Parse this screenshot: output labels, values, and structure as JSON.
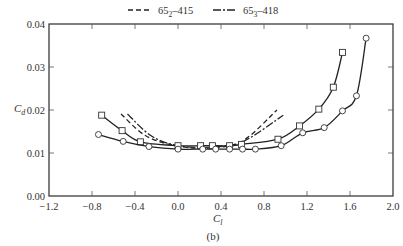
{
  "chart_data": {
    "type": "line",
    "title": "",
    "caption": "(b)",
    "xlabel": "C_l",
    "ylabel": "C_d",
    "xlim": [
      -1.2,
      2.0
    ],
    "ylim": [
      0.0,
      0.04
    ],
    "xticks": [
      -1.2,
      -0.8,
      -0.4,
      0.0,
      0.4,
      0.8,
      1.2,
      1.6,
      2.0
    ],
    "xtick_labels": [
      "−1.2",
      "−0.8",
      "−0.4",
      "0.0",
      "0.4",
      "0.8",
      "1.2",
      "1.6",
      "2.0"
    ],
    "yticks": [
      0.0,
      0.01,
      0.02,
      0.03,
      0.04
    ],
    "ytick_labels": [
      "0.00",
      "0.01",
      "0.02",
      "0.03",
      "0.04"
    ],
    "grid": false,
    "legend_position": "top-center",
    "legend": [
      {
        "label_main": "65",
        "label_sub": "2",
        "label_rest": "–415",
        "style": "dashed"
      },
      {
        "label_main": "65",
        "label_sub": "3",
        "label_rest": "–418",
        "style": "dash-dot"
      }
    ],
    "series": [
      {
        "name": "65₂–415",
        "style": "dashed",
        "marker": "none",
        "x": [
          -0.53,
          -0.3,
          0.0,
          0.3,
          0.6,
          0.92
        ],
        "y": [
          0.0191,
          0.014,
          0.0116,
          0.0112,
          0.0128,
          0.02
        ]
      },
      {
        "name": "65₃–418",
        "style": "dash-dot",
        "marker": "none",
        "x": [
          -0.47,
          -0.25,
          0.0,
          0.3,
          0.6,
          0.98
        ],
        "y": [
          0.0191,
          0.014,
          0.0117,
          0.0114,
          0.0126,
          0.0188
        ]
      },
      {
        "name": "experimental (squares)",
        "style": "solid",
        "marker": "square",
        "x": [
          -0.71,
          -0.52,
          -0.35,
          0.0,
          0.21,
          0.32,
          0.48,
          0.59,
          0.93,
          1.13,
          1.31,
          1.445,
          1.53
        ],
        "y": [
          0.0188,
          0.0152,
          0.0126,
          0.0117,
          0.0117,
          0.0117,
          0.0117,
          0.012,
          0.0132,
          0.0163,
          0.0202,
          0.0253,
          0.0334
        ]
      },
      {
        "name": "experimental (circles)",
        "style": "solid",
        "marker": "circle",
        "x": [
          -0.74,
          -0.51,
          -0.27,
          0.0,
          0.23,
          0.35,
          0.48,
          0.6,
          0.72,
          0.96,
          1.16,
          1.36,
          1.53,
          1.66,
          1.75
        ],
        "y": [
          0.0143,
          0.0127,
          0.0115,
          0.0109,
          0.0109,
          0.0109,
          0.0109,
          0.0109,
          0.0109,
          0.0117,
          0.0147,
          0.0159,
          0.0198,
          0.0233,
          0.0367
        ]
      }
    ]
  }
}
